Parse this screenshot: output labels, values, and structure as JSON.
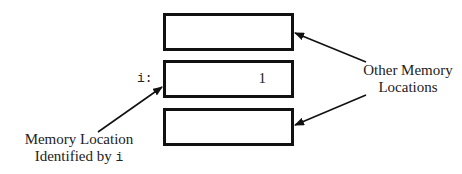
{
  "diagram": {
    "type": "memory-layout",
    "cells": [
      {
        "id": "cell-top",
        "value": ""
      },
      {
        "id": "cell-i",
        "variable": "i:",
        "value": "1"
      },
      {
        "id": "cell-bottom",
        "value": ""
      }
    ],
    "labels": {
      "left_line1": "Memory Location",
      "left_line2_prefix": "Identified by",
      "left_line2_code": "i",
      "right_line1": "Other Memory",
      "right_line2": "Locations"
    },
    "colors": {
      "stroke": "#111111",
      "text": "#222222",
      "background": "#ffffff"
    }
  }
}
